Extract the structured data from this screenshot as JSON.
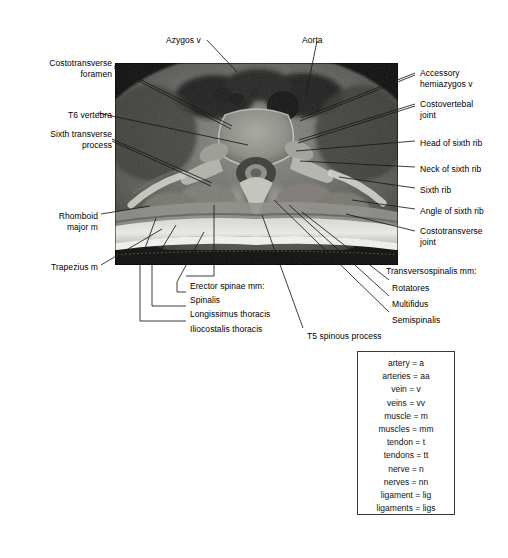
{
  "plate": {
    "modality_caption": "axial thoracic spine section at T6",
    "image_alt": "Axial cross-sectional scan of the thoracic spine at the T6 level"
  },
  "labels_top": [
    {
      "id": "azygos-vein",
      "text": "Azygos v",
      "x": 166,
      "y": 35,
      "align": "left"
    },
    {
      "id": "aorta",
      "text": "Aorta",
      "x": 302,
      "y": 35,
      "align": "left"
    }
  ],
  "labels_left": [
    {
      "id": "costotransverse-foramen",
      "text": "Costotransverse\nforamen",
      "x": 14,
      "y": 58,
      "align": "right",
      "w": 98
    },
    {
      "id": "t6-vertebra",
      "text": "T6 vertebra",
      "x": 14,
      "y": 110,
      "align": "right",
      "w": 98
    },
    {
      "id": "sixth-transverse-process",
      "text": "Sixth transverse\nprocess",
      "x": 14,
      "y": 129,
      "align": "right",
      "w": 98
    },
    {
      "id": "rhomboid-major-m",
      "text": "Rhomboid\nmajor m",
      "x": 14,
      "y": 211,
      "align": "right",
      "w": 84
    },
    {
      "id": "trapezius-m",
      "text": "Trapezius m",
      "x": 14,
      "y": 262,
      "align": "right",
      "w": 84
    }
  ],
  "labels_right": [
    {
      "id": "accessory-hemiazygos-vein",
      "text": "Accessory\nhemiazygos v",
      "x": 420,
      "y": 68,
      "align": "left"
    },
    {
      "id": "costovertebal-joint",
      "text": "Costovertebal\njoint",
      "x": 420,
      "y": 99,
      "align": "left"
    },
    {
      "id": "head-of-sixth-rib",
      "text": "Head of sixth rib",
      "x": 420,
      "y": 138,
      "align": "left"
    },
    {
      "id": "neck-of-sixth-rib",
      "text": "Neck of sixth rib",
      "x": 420,
      "y": 164,
      "align": "left"
    },
    {
      "id": "sixth-rib",
      "text": "Sixth rib",
      "x": 420,
      "y": 185,
      "align": "left"
    },
    {
      "id": "angle-of-sixth-rib",
      "text": "Angle of sixth rib",
      "x": 420,
      "y": 206,
      "align": "left"
    },
    {
      "id": "costotransverse-joint",
      "text": "Costotransverse\njoint",
      "x": 420,
      "y": 226,
      "align": "left"
    }
  ],
  "labels_erector": {
    "group_id": "erector-spinae-group",
    "items": [
      {
        "id": "erector-spinae-mm",
        "text": "Erector spinae mm:",
        "x": 190,
        "y": 281
      },
      {
        "id": "spinalis",
        "text": "Spinalis",
        "x": 190,
        "y": 295
      },
      {
        "id": "longissimus-thoracis",
        "text": "Longissimus thoracis",
        "x": 190,
        "y": 309
      },
      {
        "id": "iliocostalis-thoracis",
        "text": "Iliocostalis thoracis",
        "x": 190,
        "y": 324
      }
    ]
  },
  "labels_transversospinalis": {
    "group_id": "transversospinalis-group",
    "items": [
      {
        "id": "transversospinalis-mm",
        "text": "Transversospinalis mm:",
        "x": 386,
        "y": 266
      },
      {
        "id": "rotatores",
        "text": "Rotatores",
        "x": 392,
        "y": 283
      },
      {
        "id": "multifidus",
        "text": "Multifidus",
        "x": 392,
        "y": 299
      },
      {
        "id": "semispinalis",
        "text": "Semispinalis",
        "x": 392,
        "y": 315
      }
    ]
  },
  "labels_bottom": [
    {
      "id": "t5-spinous-process",
      "text": "T5 spinous process",
      "x": 307,
      "y": 331,
      "align": "left"
    }
  ],
  "key_box": {
    "title": "",
    "entries": [
      "artery = a",
      "arteries = aa",
      "vein = v",
      "veins = vv",
      "muscle = m",
      "muscles = mm",
      "tendon = t",
      "tendons = tt",
      "nerve = n",
      "nerves = nn",
      "ligament = lig",
      "ligaments = ligs"
    ]
  },
  "colors": {
    "page_background": "#ffffff",
    "text": "#000000",
    "leader_line": "#1a1a1a",
    "key_border": "#3a3a3a",
    "scan_dark": "#111111",
    "scan_mid": "#8a8a8a",
    "scan_bright": "#e8e8e4"
  }
}
